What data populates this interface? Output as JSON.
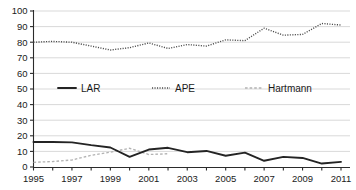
{
  "chart_data": {
    "type": "line",
    "title": "",
    "subtitle": "",
    "xlabel": "",
    "ylabel": "",
    "xlim": [
      1995,
      2011
    ],
    "ylim": [
      0,
      100
    ],
    "grid": true,
    "legend_position": "middle-center",
    "x": [
      1995,
      1996,
      1997,
      1998,
      1999,
      2000,
      2001,
      2002,
      2003,
      2004,
      2005,
      2006,
      2007,
      2008,
      2009,
      2010,
      2011
    ],
    "xtick_labels": [
      "1995",
      "1997",
      "1999",
      "2001",
      "2003",
      "2005",
      "2007",
      "2009",
      "2011"
    ],
    "xticks": [
      1995,
      1997,
      1999,
      2001,
      2003,
      2005,
      2007,
      2009,
      2011
    ],
    "ytick_labels": [
      "0",
      "10",
      "20",
      "30",
      "40",
      "50",
      "60",
      "70",
      "80",
      "90",
      "100"
    ],
    "yticks": [
      0,
      10,
      20,
      30,
      40,
      50,
      60,
      70,
      80,
      90,
      100
    ],
    "series": [
      {
        "name": "LAR",
        "style": "solid",
        "color": "#242424",
        "values": [
          16.0,
          16.0,
          15.8,
          14.0,
          12.5,
          6.5,
          11.2,
          12.3,
          9.5,
          10.3,
          7.2,
          9.2,
          4.0,
          6.5,
          5.8,
          2.2,
          3.3
        ]
      },
      {
        "name": "APE",
        "style": "dotted",
        "color": "#4a4a4a",
        "values": [
          80.0,
          80.5,
          80.0,
          77.5,
          75.0,
          76.5,
          79.5,
          76.0,
          78.5,
          77.5,
          81.5,
          81.0,
          89.0,
          84.5,
          85.0,
          92.0,
          91.0
        ]
      },
      {
        "name": "Hartmann",
        "style": "dashed",
        "color": "#b2b2b2",
        "values": [
          3.0,
          3.5,
          4.5,
          7.5,
          9.5,
          12.0,
          8.0,
          8.5,
          null,
          null,
          null,
          null,
          null,
          null,
          null,
          null,
          null
        ]
      }
    ]
  },
  "legend": {
    "items": [
      {
        "label": "LAR"
      },
      {
        "label": "APE"
      },
      {
        "label": "Hartmann"
      }
    ]
  }
}
